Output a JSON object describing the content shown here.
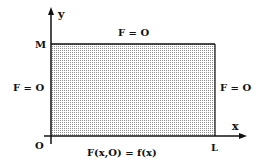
{
  "diagram": {
    "axes": {
      "x_label": "x",
      "y_label": "y",
      "origin_label": "O"
    },
    "points": {
      "top_left": "M",
      "bottom_right": "L"
    },
    "boundary_conditions": {
      "top": "F = O",
      "left": "F = O",
      "right": "F = O",
      "bottom": "F(x,O) = f(x)"
    },
    "colors": {
      "line": "#111111",
      "fill_dots": "#9a9a9a",
      "background": "#ffffff"
    }
  }
}
